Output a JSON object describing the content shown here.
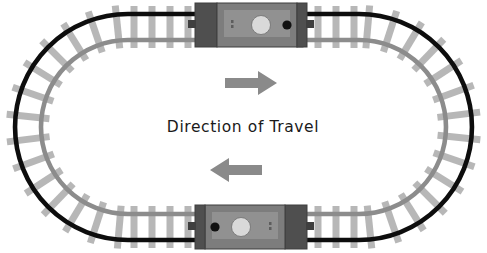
{
  "diagram": {
    "title_label": "Direction of Travel",
    "caption_text": "Direction of Travel",
    "arrow_right_name": "arrow-right",
    "arrow_left_name": "arrow-left",
    "background_color": "#ffffff"
  },
  "colors": {
    "outer_rail": "#0d0d0d",
    "inner_rail": "#8c8c8c",
    "sleeper": "#b4b4b4",
    "arrow": "#8a8a8a",
    "text": "#1a1a1a",
    "car_body": "#7d7d7d",
    "car_body_light": "#9a9a9a",
    "car_body_dark": "#5a5a5a",
    "car_end_dark": "#4f4f4f",
    "car_outline": "#3f3f3f",
    "headlight": "#d9d9d9",
    "dot_dark": "#111111"
  },
  "track": {
    "shape": "oval-loop",
    "outer_rail_label": "outer rail",
    "inner_rail_label": "inner rail",
    "sleeper_label": "sleeper",
    "sleeper_count": 44
  },
  "trains": [
    {
      "id": "top-train-car",
      "name": "train-car-top",
      "position": "top-straight",
      "heading": "right",
      "headlight_label": "headlight",
      "marker_label": "marker-dot"
    },
    {
      "id": "bottom-train-car",
      "name": "train-car-bottom",
      "position": "bottom-straight",
      "heading": "left",
      "headlight_label": "headlight",
      "marker_label": "marker-dot"
    }
  ],
  "arrows": [
    {
      "id": "arrow-top",
      "direction": "right",
      "meaning": "travel direction on top straight"
    },
    {
      "id": "arrow-bottom",
      "direction": "left",
      "meaning": "travel direction on bottom straight"
    }
  ]
}
